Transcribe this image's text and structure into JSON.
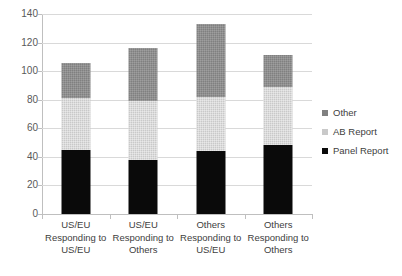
{
  "chart_data": {
    "type": "bar",
    "stacked": true,
    "title": "",
    "subtitle": "",
    "xlabel": "",
    "ylabel": "",
    "ylim": [
      0,
      140
    ],
    "yticks": [
      0,
      20,
      40,
      60,
      80,
      100,
      120,
      140
    ],
    "ytick_labels": [
      "0",
      "20",
      "40",
      "60",
      "80",
      "100",
      "120",
      "140"
    ],
    "grid": true,
    "legend_position": "right",
    "categories": [
      "US/EU Responding to US/EU",
      "US/EU Responding to Others",
      "Others Responding to US/EU",
      "Others Responding to Others"
    ],
    "category_lines": [
      {
        "l1": "US/EU",
        "l2": "Responding to",
        "l3": "US/EU"
      },
      {
        "l1": "US/EU",
        "l2": "Responding to",
        "l3": "Others"
      },
      {
        "l1": "Others",
        "l2": "Responding to",
        "l3": "US/EU"
      },
      {
        "l1": "Others",
        "l2": "Responding to",
        "l3": "Others"
      }
    ],
    "series": [
      {
        "name": "Panel Report",
        "color": "#0a0a0a",
        "values": [
          45,
          38,
          44,
          48
        ]
      },
      {
        "name": "AB Report",
        "color": "#c9c9c9",
        "values": [
          36,
          41,
          38,
          41
        ]
      },
      {
        "name": "Other",
        "color": "#808080",
        "values": [
          25,
          37,
          51,
          22
        ]
      }
    ],
    "totals": [
      106,
      116,
      133,
      111
    ]
  },
  "legend": {
    "items": [
      {
        "label": "Other",
        "swatch": "other-swatch"
      },
      {
        "label": "AB Report",
        "swatch": "ab-report-swatch"
      },
      {
        "label": "Panel Report",
        "swatch": "panel-report-swatch"
      }
    ]
  }
}
